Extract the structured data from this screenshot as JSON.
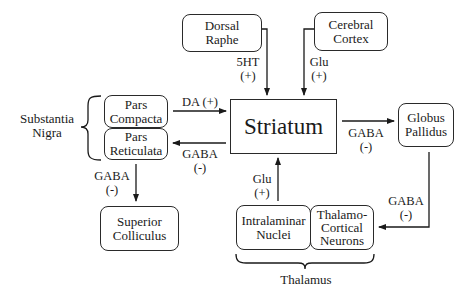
{
  "diagram": {
    "nodes": {
      "dorsal_raphe": {
        "line1": "Dorsal",
        "line2": "Raphe"
      },
      "cerebral_cortex": {
        "line1": "Cerebral",
        "line2": "Cortex"
      },
      "striatum": {
        "label": "Striatum"
      },
      "pars_compacta": {
        "line1": "Pars",
        "line2": "Compacta"
      },
      "pars_reticulata": {
        "line1": "Pars",
        "line2": "Reticulata"
      },
      "globus_pallidus": {
        "line1": "Globus",
        "line2": "Pallidus"
      },
      "superior_colliculus": {
        "line1": "Superior",
        "line2": "Colliculus"
      },
      "intralaminar_nuclei": {
        "line1": "Intralaminar",
        "line2": "Nuclei"
      },
      "thalamocortical_neurons": {
        "line1": "Thalamo-",
        "line2": "Cortical",
        "line3": "Neurons"
      }
    },
    "groups": {
      "substantia_nigra": {
        "line1": "Substantia",
        "line2": "Nigra"
      },
      "thalamus": {
        "label": "Thalamus"
      }
    },
    "edges": {
      "raphe_to_striatum": {
        "line1": "5HT",
        "line2": "(+)"
      },
      "cortex_to_striatum": {
        "line1": "Glu",
        "line2": "(+)"
      },
      "compacta_to_striatum": {
        "label": "DA (+)"
      },
      "striatum_to_reticulata": {
        "line1": "GABA",
        "line2": "(-)"
      },
      "striatum_to_pallidus": {
        "line1": "GABA",
        "line2": "(-)"
      },
      "reticulata_to_colliculus": {
        "line1": "GABA",
        "line2": "(-)"
      },
      "intralaminar_to_striatum": {
        "line1": "Glu",
        "line2": "(+)"
      },
      "pallidus_to_thalamocortical": {
        "line1": "GABA",
        "line2": "(-)"
      }
    }
  }
}
